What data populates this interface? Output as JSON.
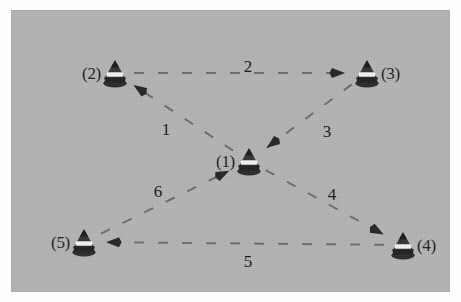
{
  "figure": {
    "background_color": "#b4b4b4",
    "frame_color": "#fdfdfd",
    "line_color": "#6e6e6e",
    "text_color": "#1d1d1d"
  },
  "nodes": [
    {
      "id": "1",
      "label": "(1)",
      "x": 238,
      "y": 151,
      "label_side": "left",
      "icon": "cone-buoy-icon"
    },
    {
      "id": "2",
      "label": "(2)",
      "x": 104,
      "y": 63,
      "label_side": "left",
      "icon": "cone-buoy-icon"
    },
    {
      "id": "3",
      "label": "(3)",
      "x": 356,
      "y": 63,
      "label_side": "right",
      "icon": "cone-buoy-icon"
    },
    {
      "id": "4",
      "label": "(4)",
      "x": 392,
      "y": 235,
      "label_side": "right",
      "icon": "cone-buoy-icon"
    },
    {
      "id": "5",
      "label": "(5)",
      "x": 73,
      "y": 232,
      "label_side": "left",
      "icon": "cone-buoy-icon"
    }
  ],
  "edges": [
    {
      "id": "e1",
      "label": "1",
      "from": "1",
      "to": "2",
      "label_x": 155,
      "label_y": 119
    },
    {
      "id": "e2",
      "label": "2",
      "from": "2",
      "to": "3",
      "label_x": 237,
      "label_y": 56
    },
    {
      "id": "e3",
      "label": "3",
      "from": "3",
      "to": "1",
      "label_x": 316,
      "label_y": 121
    },
    {
      "id": "e4",
      "label": "4",
      "from": "1",
      "to": "4",
      "label_x": 321,
      "label_y": 184
    },
    {
      "id": "e5",
      "label": "5",
      "from": "4",
      "to": "5",
      "label_x": 237,
      "label_y": 251
    },
    {
      "id": "e6",
      "label": "6",
      "from": "5",
      "to": "1",
      "label_x": 147,
      "label_y": 181
    }
  ],
  "style": {
    "dash_pattern": "10 14",
    "stroke_width": 2
  }
}
